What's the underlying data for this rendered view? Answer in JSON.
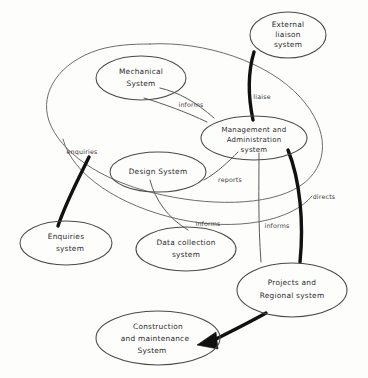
{
  "diagram": {
    "style": "hand-drawn sketch",
    "background_color": "#fdfdfc",
    "ink_color": "#2b2b2b",
    "bold_ink_color": "#111111",
    "boundary": {
      "name": "organisation boundary",
      "label": ""
    },
    "nodes": [
      {
        "id": "external-liaison-system",
        "lines": [
          "External",
          "liaison",
          "system"
        ],
        "line1": "External",
        "line2": "liaison",
        "line3": "system",
        "inside_boundary": false
      },
      {
        "id": "mechanical-system",
        "lines": [
          "Mechanical",
          "System"
        ],
        "line1": "Mechanical",
        "line2": "System",
        "inside_boundary": true
      },
      {
        "id": "management-and-administration-system",
        "lines": [
          "Management and",
          "Administration",
          "system"
        ],
        "line1": "Management and",
        "line2": "Administration",
        "line3": "system",
        "inside_boundary": true
      },
      {
        "id": "design-system",
        "lines": [
          "Design System"
        ],
        "line1": "Design System",
        "inside_boundary": true
      },
      {
        "id": "enquiries-system",
        "lines": [
          "Enquiries",
          "system"
        ],
        "line1": "Enquiries",
        "line2": "system",
        "inside_boundary": false
      },
      {
        "id": "data-collection-system",
        "lines": [
          "Data collection",
          "system"
        ],
        "line1": "Data collection",
        "line2": "system",
        "inside_boundary": false
      },
      {
        "id": "projects-and-regional-system",
        "lines": [
          "Projects and",
          "Regional system"
        ],
        "line1": "Projects and",
        "line2": "Regional system",
        "inside_boundary": false
      },
      {
        "id": "construction-and-maintenance-system",
        "lines": [
          "Construction",
          "and maintenance",
          "System"
        ],
        "line1": "Construction",
        "line2": "and maintenance",
        "line3": "System",
        "inside_boundary": false
      }
    ],
    "links": [
      {
        "id": "mechanical-informs-management",
        "label": "informs",
        "from": "mechanical-system",
        "to": "management-and-administration-system",
        "weight": "thin",
        "arrow": false
      },
      {
        "id": "external-liaison-liaise-management",
        "label": "liaise",
        "from": "external-liaison-system",
        "to": "management-and-administration-system",
        "weight": "thick",
        "arrow": false
      },
      {
        "id": "design-reports-management",
        "label": "reports",
        "from": "design-system",
        "to": "management-and-administration-system",
        "weight": "thin",
        "arrow": false
      },
      {
        "id": "enquiries-enquiries-boundary",
        "label": "enquiries",
        "from": "enquiries-system",
        "to": "design-system",
        "weight": "thick",
        "arrow": false
      },
      {
        "id": "design-informs-data-collection",
        "label": "informs",
        "from": "design-system",
        "to": "data-collection-system",
        "weight": "thin",
        "arrow": false
      },
      {
        "id": "management-informs-projects",
        "label": "informs",
        "from": "management-and-administration-system",
        "to": "projects-and-regional-system",
        "weight": "thin",
        "arrow": false
      },
      {
        "id": "management-directs-projects",
        "label": "directs",
        "from": "management-and-administration-system",
        "to": "projects-and-regional-system",
        "weight": "thick",
        "arrow": false
      },
      {
        "id": "projects-to-construction",
        "label": "",
        "from": "projects-and-regional-system",
        "to": "construction-and-maintenance-system",
        "weight": "thick",
        "arrow": true
      }
    ]
  }
}
